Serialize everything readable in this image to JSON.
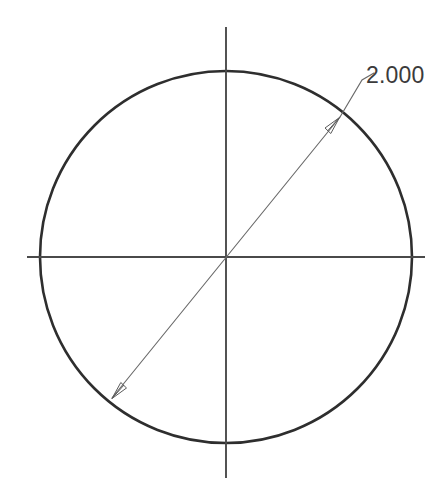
{
  "drawing": {
    "type": "cad-sketch",
    "background_color": "#ffffff",
    "canvas": {
      "width": 447,
      "height": 497
    },
    "entities": {
      "circle": {
        "name": "circle",
        "center": {
          "x": 226,
          "y": 257
        },
        "radius": 186,
        "stroke_color": "#2e2e2e",
        "stroke_width": 2.6
      },
      "horizontal_centerline": {
        "name": "horizontal-centerline",
        "x1": 27,
        "y1": 257,
        "x2": 425,
        "y2": 257,
        "stroke_color": "#4a4a4a",
        "stroke_width": 1.9
      },
      "vertical_centerline": {
        "name": "vertical-centerline",
        "x1": 226,
        "y1": 27,
        "x2": 226,
        "y2": 478,
        "stroke_color": "#4a4a4a",
        "stroke_width": 1.9
      },
      "diameter_dimension": {
        "name": "diameter-dimension-line",
        "start": {
          "x": 112,
          "y": 398
        },
        "end": {
          "x": 340,
          "y": 117
        },
        "stroke_color": "#6a6a6a",
        "stroke_width": 1.15,
        "arrow_start": {
          "x": 112,
          "y": 398
        },
        "arrow_end": {
          "x": 340,
          "y": 117
        }
      },
      "leader": {
        "name": "dimension-leader-line",
        "elbow": {
          "x": 362,
          "y": 78
        },
        "shoulder_end": {
          "x": 372,
          "y": 72
        },
        "stroke_color": "#6a6a6a",
        "stroke_width": 1.15
      }
    },
    "dimension_label": {
      "value": "2.000",
      "x": 366,
      "y": 64,
      "font_size": 23,
      "color": "#3b3b3b"
    }
  }
}
